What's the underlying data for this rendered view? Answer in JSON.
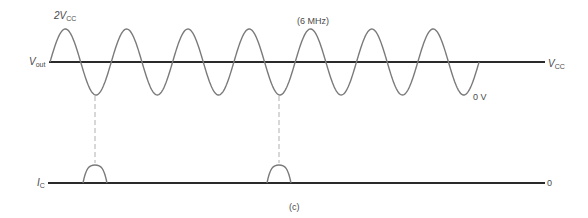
{
  "diagram": {
    "figure_label": "(c)",
    "frequency_label": "(6 MHz)",
    "vout": {
      "label_main": "V",
      "label_sub": "out",
      "peak_label_prefix": "2V",
      "peak_label_sub": "CC",
      "right_label_main": "V",
      "right_label_sub": "CC",
      "min_label": "0 V",
      "cycles": 7
    },
    "ic": {
      "label_main": "I",
      "label_sub": "C",
      "right_label": "0",
      "pulse_count": 2
    },
    "colors": {
      "waveform": "#7a7a7a",
      "axis": "#2a2a2a",
      "dashed": "#b0b0b0",
      "text": "#4a4a4a"
    }
  }
}
